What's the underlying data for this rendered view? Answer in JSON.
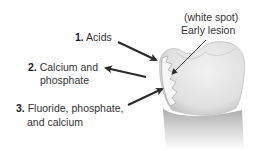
{
  "diagram": {
    "labels": {
      "lesion": {
        "line1": "(white spot)",
        "line2": "Early lesion"
      },
      "item1": {
        "number": "1.",
        "text": "Acids"
      },
      "item2": {
        "number": "2.",
        "line1": "Calcium and",
        "line2": "phosphate"
      },
      "item3": {
        "number": "3.",
        "line1": "Fluoride, phosphate,",
        "line2": "and calcium"
      }
    },
    "arrows": [
      {
        "id": "acids",
        "direction": "into-tooth"
      },
      {
        "id": "calcium-phosphate",
        "direction": "out-of-tooth"
      },
      {
        "id": "fluoride-phosphate-calcium",
        "direction": "into-tooth"
      },
      {
        "id": "lesion-pointer",
        "direction": "to-white-spot"
      }
    ],
    "colors": {
      "text": "#333333",
      "arrow": "#2b2b2b",
      "tooth": "#e6e6e6",
      "tooth_shadow": "#9a9a9a",
      "lesion": "#f4f4f4"
    }
  }
}
